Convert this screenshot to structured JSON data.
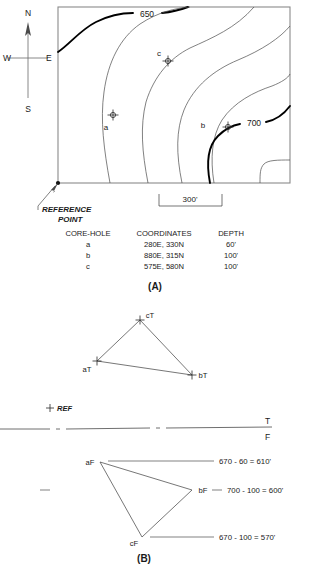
{
  "figure": {
    "panel_a_label": "(A)",
    "panel_b_label": "(B)"
  },
  "compass": {
    "north": "N",
    "south": "S",
    "east": "E",
    "west": "W"
  },
  "map": {
    "contour_labels": [
      {
        "id": "contour-650",
        "text": "650"
      },
      {
        "id": "contour-700",
        "text": "700"
      }
    ],
    "core_hole_labels": [
      {
        "id": "core-hole-a",
        "text": "a"
      },
      {
        "id": "core-hole-b",
        "text": "b"
      },
      {
        "id": "core-hole-c",
        "text": "c"
      }
    ],
    "reference_point_line1": "REFERENCE",
    "reference_point_line2": "POINT",
    "scale_label": "300'"
  },
  "table": {
    "headers": [
      "CORE-HOLE",
      "COORDINATES",
      "DEPTH"
    ],
    "rows": [
      {
        "hole": "a",
        "coordinates": "280E, 330N",
        "depth": "60'"
      },
      {
        "hole": "b",
        "coordinates": "880E, 315N",
        "depth": "100'"
      },
      {
        "hole": "c",
        "coordinates": "575E, 580N",
        "depth": "100'"
      }
    ]
  },
  "top_view": {
    "vertices": [
      {
        "id": "vertex-aT",
        "text": "aT"
      },
      {
        "id": "vertex-bT",
        "text": "bT"
      },
      {
        "id": "vertex-cT",
        "text": "cT"
      }
    ]
  },
  "fold_line": {
    "ref_marker": "REF",
    "top_label": "T",
    "front_label": "F"
  },
  "front_view": {
    "vertices": [
      {
        "id": "vertex-aF",
        "text": "aF"
      },
      {
        "id": "vertex-bF",
        "text": "bF"
      },
      {
        "id": "vertex-cF",
        "text": "cF"
      }
    ],
    "elevations": [
      {
        "id": "elev-a",
        "text": "670 - 60 = 610'"
      },
      {
        "id": "elev-b",
        "text": "700 - 100 = 600'"
      },
      {
        "id": "elev-c",
        "text": "670 - 100 = 570'"
      }
    ]
  }
}
